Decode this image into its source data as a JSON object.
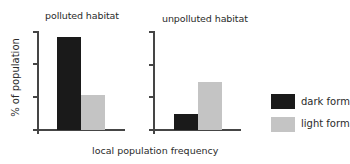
{
  "chart_data": [
    {
      "type": "bar",
      "title": "polluted habitat",
      "categories": [
        "dark form",
        "light form"
      ],
      "values": [
        95,
        36
      ],
      "xlabel": "local population frequency",
      "ylabel": "% of population",
      "ylim": [
        0,
        100
      ],
      "yticks": 4,
      "ytick_labels": [],
      "grid": false
    },
    {
      "type": "bar",
      "title": "unpolluted habitat",
      "categories": [
        "dark form",
        "light form"
      ],
      "values": [
        16,
        49
      ],
      "xlabel": "local population frequency",
      "ylabel": "% of population",
      "ylim": [
        0,
        100
      ],
      "yticks": 4,
      "ytick_labels": [],
      "grid": false
    }
  ],
  "panels": [
    {
      "title": "polluted habitat"
    },
    {
      "title": "unpolluted habitat"
    }
  ],
  "axes": {
    "ylabel": "% of population",
    "xlabel": "local population frequency"
  },
  "legend": {
    "position": "right",
    "items": [
      {
        "label": "dark form",
        "color": "#1a1a1a"
      },
      {
        "label": "light form",
        "color": "#c4c4c4"
      }
    ]
  },
  "colors": {
    "dark_form": "#1a1a1a",
    "light_form": "#c4c4c4",
    "axis": "#454545"
  }
}
